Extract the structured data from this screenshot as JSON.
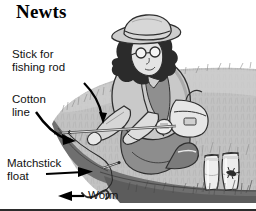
{
  "figure": {
    "title": "Newts",
    "bottom_rule_color": "#2b2b2b",
    "background_color": "#ffffff"
  },
  "callouts": [
    {
      "id": "stick-for-fishing-rod",
      "label": "Stick for\nfishing rod",
      "arrow": "curved-down-right",
      "points_to": "fishing rod stick"
    },
    {
      "id": "cotton-line",
      "label": "Cotton\nline",
      "arrow": "curved-down-right",
      "points_to": "cotton fishing line"
    },
    {
      "id": "matchstick-float",
      "label": "Matchstick\nfloat",
      "arrow": "straight-right",
      "points_to": "matchstick float on line"
    },
    {
      "id": "worm",
      "label": "Worm",
      "arrow": "straight-left",
      "points_to": "worm on hook"
    }
  ],
  "scene": {
    "description": "Person kneeling on a grassy riverbank fishing for newts with a stick, cotton line, matchstick float and a worm; two glass jars stand on the bank, one holding a newt.",
    "elements": [
      "grassy-bank",
      "person-kneeling",
      "wide-brim-hat",
      "round-glasses",
      "spiky-hair",
      "satchel-bag",
      "fishing-rod-stick",
      "cotton-line",
      "matchstick-float",
      "worm",
      "glass-jar-empty",
      "glass-jar-with-newt",
      "water"
    ]
  },
  "palette": {
    "ink": "#2b2b2b",
    "grass_light": "#d7d7d7",
    "grass_mid": "#b8b8b8",
    "grass_dark": "#8f8f8f",
    "bank_edge": "#6e6e6e",
    "coat": "#c9c9c9",
    "coat_shadow": "#a6a6a6",
    "trousers": "#8a8a8a",
    "skin": "#e2e2e2",
    "hat": "#cfcfcf",
    "jar_glass": "#ededed",
    "water": "#ffffff"
  }
}
